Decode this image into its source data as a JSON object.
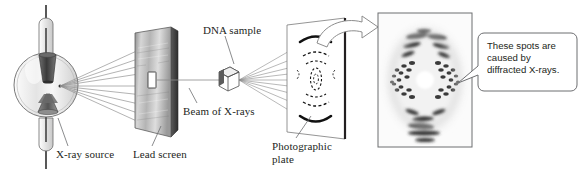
{
  "diagram": {
    "background_color": "#ffffff",
    "labels": {
      "xray_source": "X-ray source",
      "lead_screen": "Lead screen",
      "dna_sample": "DNA sample",
      "beam_of_xrays": "Beam of X-rays",
      "photographic_plate_line1": "Photographic",
      "photographic_plate_line2": "plate"
    },
    "callout": {
      "line1": "These spots are",
      "line2": "caused by",
      "line3": "diffracted X-rays.",
      "border_color": "#6d6e71",
      "text_color": "#231f20"
    },
    "components": {
      "xray_tube": {
        "name": "X-ray source tube",
        "glass_color": "#f2f2f2",
        "outline_color": "#58595b",
        "anode_color": "#4d4d4d",
        "cathode_color": "#707070"
      },
      "lead_screen": {
        "name": "Lead screen with slit",
        "face_color_light": "#d9d9d9",
        "face_color_dark": "#8a8a8a",
        "edge_color": "#4a4a4a",
        "slit_color": "#ffffff"
      },
      "dna_sample": {
        "name": "DNA sample cube",
        "fill_color": "#ffffff",
        "outline_color": "#4d4d4d"
      },
      "photographic_plate": {
        "name": "Photographic plate",
        "fill_color": "#ffffff",
        "outline_color": "#58595b",
        "edge_color": "#231f20",
        "pattern_color": "#111111"
      },
      "photograph": {
        "name": "Photo 51 X-ray diffraction photograph",
        "frame_color": "#6d6e71",
        "background_color": "#fbfbfb",
        "spot_color": "#2b2b2b"
      },
      "transfer_arrow": {
        "name": "Curved arrow from plate to photograph",
        "fill_color": "#ffffff",
        "outline_color": "#808080"
      }
    },
    "ray_color": "#7a7a7a",
    "leader_color": "#6d6e71"
  }
}
